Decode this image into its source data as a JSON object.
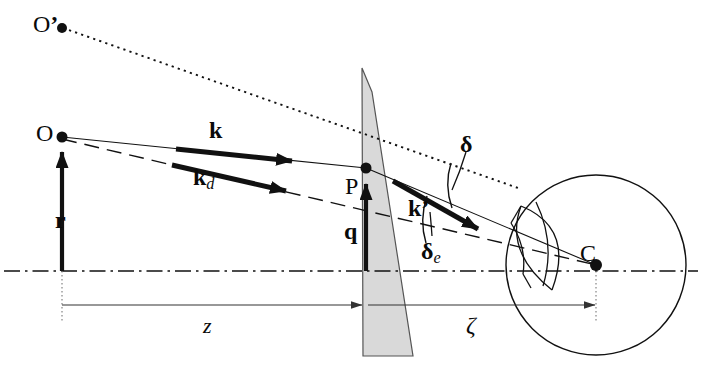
{
  "figure": {
    "type": "optics-scattering-geometry-diagram",
    "background_color": "#ffffff",
    "stroke_color": "#111111",
    "wedge_fill": "#d9d9d9",
    "width": 702,
    "height": 379
  },
  "points": [
    {
      "id": "O-prime",
      "label": "O",
      "prime": "’",
      "x": 62,
      "y": 28,
      "label_x": 33,
      "label_y": 14
    },
    {
      "id": "O",
      "label": "O",
      "prime": "",
      "x": 62,
      "y": 137,
      "label_x": 36,
      "label_y": 123
    },
    {
      "id": "P",
      "label": "P",
      "prime": "",
      "x": 366,
      "y": 168,
      "label_x": 347,
      "label_y": 176
    },
    {
      "id": "C",
      "label": "C",
      "prime": "",
      "x": 596,
      "y": 265,
      "label_x": 581,
      "label_y": 243
    }
  ],
  "vectors": [
    {
      "id": "r",
      "label": "r",
      "sub": "",
      "label_x": 57,
      "label_y": 212,
      "style": "bold"
    },
    {
      "id": "k",
      "label": "k",
      "sub": "",
      "label_x": 212,
      "label_y": 123,
      "style": "bold"
    },
    {
      "id": "kd",
      "label": "k",
      "sub": "d",
      "label_x": 196,
      "label_y": 170,
      "style": "bold"
    },
    {
      "id": "q",
      "label": "q",
      "sub": "",
      "label_x": 345,
      "label_y": 222,
      "style": "bold"
    },
    {
      "id": "kp",
      "label": "k’",
      "sub": "",
      "label_x": 410,
      "label_y": 200,
      "style": "bold"
    }
  ],
  "angles": [
    {
      "id": "delta",
      "label": "δ",
      "sub": "",
      "label_x": 462,
      "label_y": 138,
      "style": "bold"
    },
    {
      "id": "delta-e",
      "label": "δ",
      "sub": "e",
      "label_x": 424,
      "label_y": 243,
      "style": "bold"
    }
  ],
  "dimensions": [
    {
      "id": "z",
      "label": "z",
      "label_x": 205,
      "label_y": 320,
      "style": "italic",
      "from_x": 62,
      "to_x": 363,
      "y": 305
    },
    {
      "id": "zeta",
      "label": "ζ",
      "label_x": 468,
      "label_y": 320,
      "style": "italic",
      "from_x": 413,
      "to_x": 596,
      "y": 305
    }
  ],
  "elements": {
    "optical_axis": "dash-dot horizontal centerline at y=271",
    "prism_wedge": "thin shaded triangular prism, apex top",
    "detector_sphere": "large circle centered at C",
    "detector_arc": "curved arc element inside sphere",
    "ray_solid": "thin solid ray O to P to detector",
    "ray_dashed": "long-dashed ray O through P region to C",
    "ray_dotted": "dotted ray from O’ through P continuing right"
  }
}
